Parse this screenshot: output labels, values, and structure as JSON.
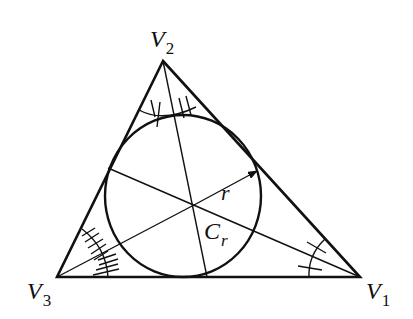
{
  "diagram": {
    "type": "triangle-incircle",
    "vertices": [
      {
        "id": "V1",
        "label": "V",
        "sub": "1",
        "x": 360,
        "y": 277
      },
      {
        "id": "V2",
        "label": "V",
        "sub": "2",
        "x": 163,
        "y": 61
      },
      {
        "id": "V3",
        "label": "V",
        "sub": "3",
        "x": 57,
        "y": 277
      }
    ],
    "incircle": {
      "label": "C",
      "sub": "r",
      "cx": 183,
      "cy": 196,
      "rx": 78,
      "ry": 81
    },
    "incenter": {
      "x": 194,
      "y": 205
    },
    "radius_label": "r",
    "angle_marks": {
      "V1": 2,
      "V2": 4,
      "V3": 10
    },
    "stroke_color": "#111111"
  }
}
